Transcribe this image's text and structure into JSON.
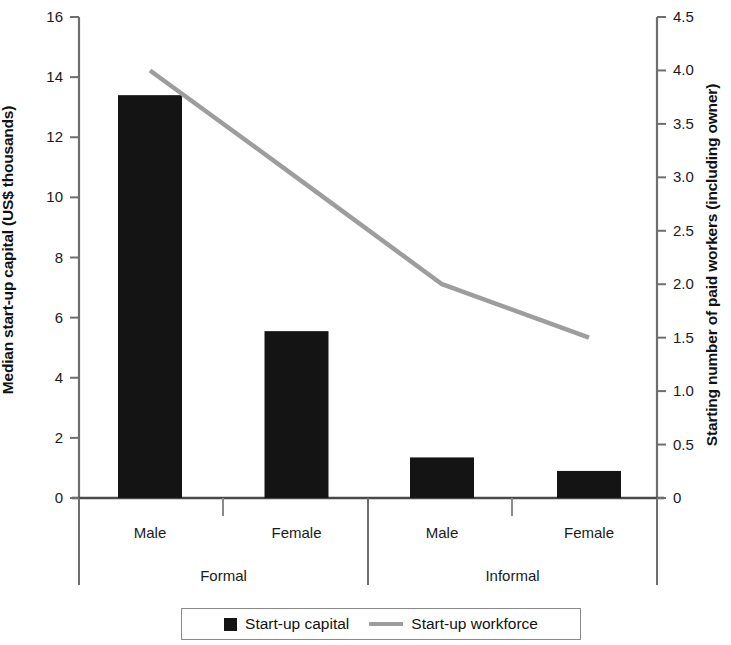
{
  "chart_data": {
    "type": "bar",
    "title": "",
    "subtitle": "",
    "categories": [
      "Male",
      "Female",
      "Male",
      "Female"
    ],
    "groups": [
      {
        "label": "Formal",
        "categories": [
          "Male",
          "Female"
        ]
      },
      {
        "label": "Informal",
        "categories": [
          "Male",
          "Female"
        ]
      }
    ],
    "series": [
      {
        "name": "Start-up capital",
        "type": "bar",
        "axis": "left",
        "color": "#141414",
        "values": [
          13.4,
          5.55,
          1.35,
          0.9
        ]
      },
      {
        "name": "Start-up workforce",
        "type": "line",
        "axis": "right",
        "color": "#9d9d9d",
        "values": [
          4.0,
          3.0,
          2.0,
          1.5
        ]
      }
    ],
    "xlabel": "",
    "ylabel": "Median start-up capital (US$ thousands)",
    "y2label": "Starting number of paid workers (including owner)",
    "ylim": [
      0,
      16
    ],
    "y2lim": [
      0,
      4.5
    ],
    "yticks": [
      "0",
      "2",
      "4",
      "6",
      "8",
      "10",
      "12",
      "14",
      "16"
    ],
    "ytick_values": [
      0,
      2,
      4,
      6,
      8,
      10,
      12,
      14,
      16
    ],
    "y2ticks": [
      "0",
      "0.5",
      "1.0",
      "1.5",
      "2.0",
      "2.5",
      "3.0",
      "3.5",
      "4.0",
      "4.5"
    ],
    "y2tick_values": [
      0,
      0.5,
      1.0,
      1.5,
      2.0,
      2.5,
      3.0,
      3.5,
      4.0,
      4.5
    ],
    "grid": false,
    "legend_position": "bottom",
    "legend": [
      {
        "label": "Start-up capital",
        "marker": "square",
        "color": "#141414"
      },
      {
        "label": "Start-up workforce",
        "marker": "line",
        "color": "#9d9d9d"
      }
    ]
  },
  "axes": {
    "left_title": "Median start-up capital (US$ thousands)",
    "right_title": "Starting number of paid workers (including owner)"
  },
  "ticks": {
    "left": [
      "16",
      "14",
      "12",
      "10",
      "8",
      "6",
      "4",
      "2",
      "0"
    ],
    "right": [
      "4.5",
      "4.0",
      "3.5",
      "3.0",
      "2.5",
      "2.0",
      "1.5",
      "1.0",
      "0.5",
      "0"
    ]
  },
  "categories": {
    "items": [
      "Male",
      "Female",
      "Male",
      "Female"
    ]
  },
  "groups": {
    "items": [
      "Formal",
      "Informal"
    ]
  },
  "legend": {
    "items": [
      "Start-up capital",
      "Start-up workforce"
    ]
  }
}
